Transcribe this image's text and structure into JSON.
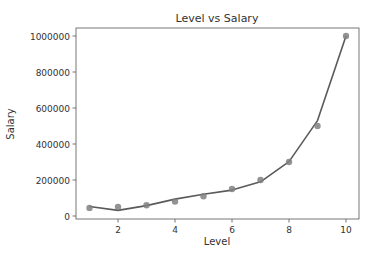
{
  "chart_data": {
    "type": "line",
    "title": "Level vs Salary",
    "xlabel": "Level",
    "ylabel": "Salary",
    "xlim": [
      0.6,
      10.45
    ],
    "ylim": [
      -15000,
      1050000
    ],
    "xticks": [
      2,
      4,
      6,
      8,
      10
    ],
    "yticks": [
      0,
      200000,
      400000,
      600000,
      800000,
      1000000
    ],
    "ytick_labels": [
      "0",
      "200000",
      "400000",
      "600000",
      "800000",
      "1000000"
    ],
    "grid": false,
    "legend": null,
    "series": [
      {
        "name": "Actual salary",
        "kind": "scatter",
        "color": "#808080",
        "x": [
          1,
          2,
          3,
          4,
          5,
          6,
          7,
          8,
          9,
          10
        ],
        "values": [
          45000,
          50000,
          60000,
          80000,
          110000,
          150000,
          200000,
          300000,
          500000,
          1000000
        ]
      },
      {
        "name": "Polynomial regression fit",
        "kind": "line",
        "color": "#5a5a5a",
        "x": [
          1,
          2,
          3,
          4,
          5,
          6,
          7,
          8,
          9,
          10
        ],
        "values": [
          53000,
          31000,
          58000,
          94000,
          121000,
          144000,
          190000,
          302000,
          530000,
          1000000
        ]
      }
    ]
  }
}
